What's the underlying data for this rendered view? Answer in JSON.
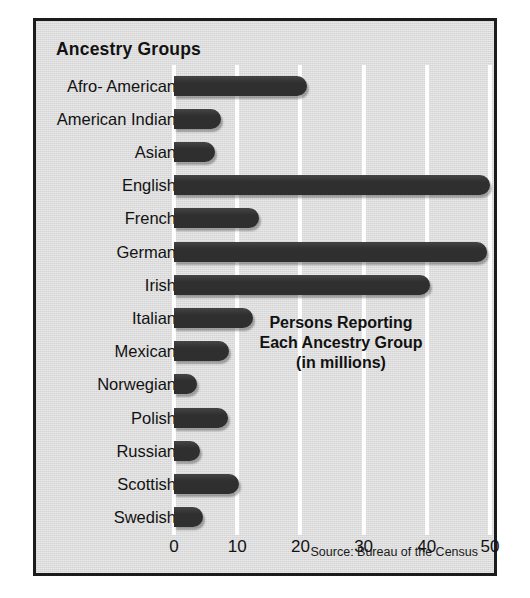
{
  "chart_data": {
    "type": "bar",
    "orientation": "horizontal",
    "title": "Ancestry Groups",
    "xlabel": "",
    "ylabel": "",
    "xlim": [
      0,
      50
    ],
    "xticks": [
      "0",
      "10",
      "20",
      "30",
      "40",
      "50"
    ],
    "xtick_values": [
      0,
      10,
      20,
      30,
      40,
      50
    ],
    "grid": true,
    "legend": "none",
    "categories": [
      "Afro- American",
      "American Indian",
      "Asian",
      "English",
      "French",
      "German",
      "Irish",
      "Italian",
      "Mexican",
      "Norwegian",
      "Polish",
      "Russian",
      "Scottish",
      "Swedish"
    ],
    "values": [
      21,
      7.4,
      6.5,
      50,
      13.4,
      49.6,
      40.5,
      12.5,
      8.7,
      3.6,
      8.5,
      4.1,
      10.3,
      4.6
    ],
    "annotation": {
      "line1": "Persons Reporting",
      "line2": "Each Ancestry Group",
      "line3": "(in millions)"
    },
    "source": "Source: Bureau of the Census",
    "colors": {
      "bar": "#2f2f2f",
      "background": "#dcdcdc",
      "gridline": "#fdfdfd",
      "border": "#1c1c1c",
      "text": "#121212"
    }
  }
}
